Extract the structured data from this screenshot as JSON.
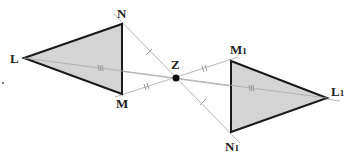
{
  "diagram": {
    "center": {
      "label": "Z",
      "x": 176,
      "y": 78
    },
    "original_triangle": {
      "vertices": [
        {
          "label": "L",
          "x": 24,
          "y": 58
        },
        {
          "label": "N",
          "x": 122,
          "y": 24
        },
        {
          "label": "M",
          "x": 122,
          "y": 94
        }
      ]
    },
    "image_triangle": {
      "vertices": [
        {
          "label": "L",
          "sub": "1",
          "x": 327,
          "y": 98
        },
        {
          "label": "M",
          "sub": "1",
          "x": 231,
          "y": 61
        },
        {
          "label": "N",
          "sub": "1",
          "x": 231,
          "y": 132
        }
      ]
    },
    "tick_marks": {
      "NZ_ZN1": "single",
      "MZ_ZM1": "double",
      "LZ_ZL1": "triple"
    },
    "colors": {
      "fill": "#d4d4d4",
      "edge": "#1a1a1a",
      "construction": "#b8b8b8"
    }
  }
}
